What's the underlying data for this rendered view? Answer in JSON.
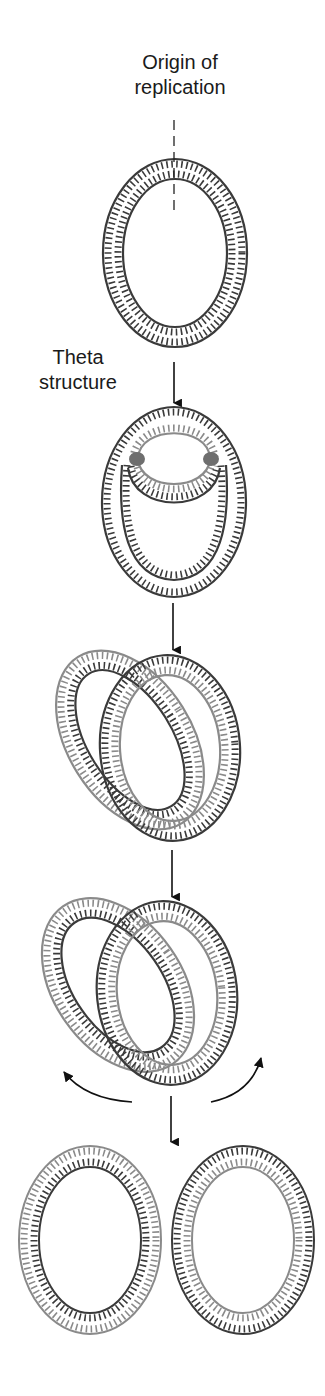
{
  "diagram": {
    "labels": {
      "origin_line1": "Origin of",
      "origin_line2": "replication",
      "theta_line1": "Theta",
      "theta_line2": "structure"
    },
    "colors": {
      "parental_strand": "#3a3a3a",
      "new_strand": "#8a8a8a",
      "fork": "#6e6e6e",
      "arrow": "#111111",
      "text": "#1a1a1a"
    },
    "stages": [
      {
        "id": "circular-dna",
        "description": "Circular double-stranded DNA with origin of replication marked"
      },
      {
        "id": "theta-structure",
        "description": "Replication bubble with two replication forks"
      },
      {
        "id": "catenated-rings-1",
        "description": "Two interlocked daughter circles"
      },
      {
        "id": "catenated-rings-2",
        "description": "Interlocked daughter circles being separated"
      },
      {
        "id": "separated-rings",
        "description": "Two separate daughter DNA circles"
      }
    ]
  }
}
